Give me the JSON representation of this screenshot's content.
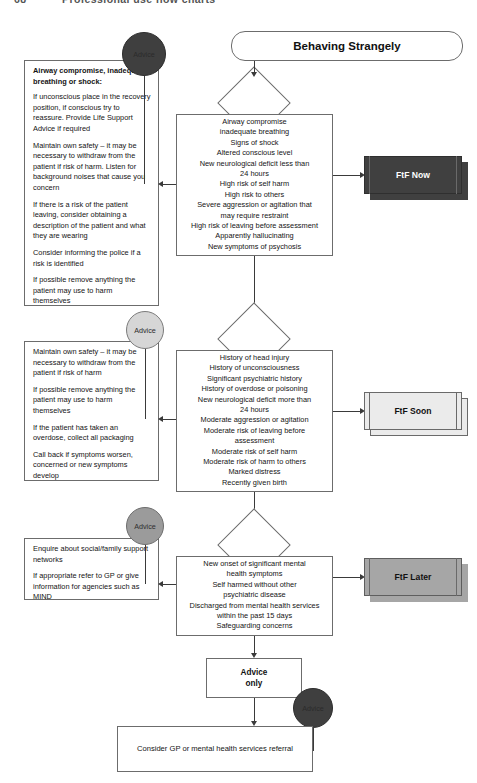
{
  "page": {
    "number": "68",
    "running_title": "Professional use flow charts"
  },
  "title": "Behaving Strangely",
  "advice_circle_label": "Advice",
  "advice_boxes": [
    {
      "heading": "Airway compromise, inadequate breathing or shock:",
      "paragraphs": [
        "If unconscious place in the recovery position, if conscious try to reassure. Provide Life Support Advice if required",
        "Maintain own safety – it may be necessary to withdraw from the patient if risk of harm. Listen for background noises that cause you concern",
        "If there is a risk of the patient leaving, consider obtaining a description of the patient and what they are wearing",
        "Consider informing the police if a risk is identified",
        "If possible remove anything the patient may use to harm themselves"
      ]
    },
    {
      "heading": "",
      "paragraphs": [
        "Maintain own safety – it may be necessary to withdraw from the patient if risk of harm",
        "If possible remove anything the patient may use to harm themselves",
        "If the patient has taken an overdose, collect all packaging",
        "Call back if symptoms worsen, concerned or new symptoms develop"
      ]
    },
    {
      "heading": "",
      "paragraphs": [
        "Enquire about social/family support networks",
        "If appropriate refer to GP or give information for agencies such as MIND"
      ]
    }
  ],
  "criteria": [
    {
      "lines": [
        "Airway compromise",
        "inadequate breathing",
        "Signs of shock",
        "Altered conscious level",
        "New neurological deficit less than",
        "24 hours",
        "High risk of self harm",
        "High risk to others",
        "Severe aggression or agitation that",
        "may require restraint",
        "High risk of leaving before assessment",
        "Apparently hallucinating",
        "New symptoms of psychosis"
      ]
    },
    {
      "lines": [
        "History of head injury",
        "History of unconsciousness",
        "Significant psychiatric history",
        "History of overdose or poisoning",
        "New neurological deficit more than",
        "24 hours",
        "Moderate aggression or agitation",
        "Moderate risk of leaving before",
        "assessment",
        "Moderate risk of self harm",
        "Moderate risk of harm to others",
        "Marked distress",
        "Recently given birth"
      ]
    },
    {
      "lines": [
        "New onset of significant mental",
        "health symptoms",
        "Self harmed without other",
        "psychiatric disease",
        "Discharged from mental health services",
        "within the past 15 days",
        "Safeguarding concerns"
      ]
    }
  ],
  "outcomes": [
    {
      "label": "FtF Now",
      "color": "#404040"
    },
    {
      "label": "FtF Soon",
      "color": "#ebebeb"
    },
    {
      "label": "FtF Later",
      "color": "#a6a6a6"
    }
  ],
  "advice_only": "Advice\nonly",
  "advice_only_line1": "Advice",
  "advice_only_line2": "only",
  "end_node": "Consider GP or mental health services referral"
}
